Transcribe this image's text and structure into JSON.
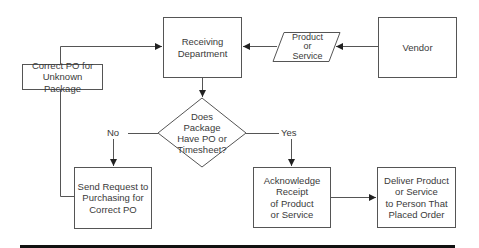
{
  "diagram": {
    "type": "flowchart",
    "nodes": {
      "receiving": {
        "label": "Receiving\nDepartment",
        "shape": "rectangle"
      },
      "product_or_service": {
        "label": "Product\nor\nService",
        "shape": "parallelogram"
      },
      "vendor": {
        "label": "Vendor",
        "shape": "rectangle"
      },
      "correct_po": {
        "label": "Correct PO for\nUnknown Package",
        "shape": "rectangle"
      },
      "decision": {
        "label": "Does\nPackage\nHave PO or\nTimesheet?",
        "shape": "diamond"
      },
      "send_request": {
        "label": "Send Request to\nPurchasing for\nCorrect PO",
        "shape": "rectangle"
      },
      "acknowledge": {
        "label": "Acknowledge\nReceipt\nof Product\nor Service",
        "shape": "rectangle"
      },
      "deliver": {
        "label": "Deliver Product\nor Service\nto Person That\nPlaced Order",
        "shape": "rectangle"
      }
    },
    "edge_labels": {
      "no": "No",
      "yes": "Yes"
    },
    "edges": [
      {
        "from": "vendor",
        "to": "product_or_service"
      },
      {
        "from": "product_or_service",
        "to": "receiving"
      },
      {
        "from": "receiving",
        "to": "decision"
      },
      {
        "from": "decision",
        "to": "send_request",
        "label": "No"
      },
      {
        "from": "decision",
        "to": "acknowledge",
        "label": "Yes"
      },
      {
        "from": "send_request",
        "to": "correct_po"
      },
      {
        "from": "correct_po",
        "to": "receiving"
      },
      {
        "from": "acknowledge",
        "to": "deliver"
      }
    ],
    "colors": {
      "stroke": "#555555",
      "text": "#3a3a3a",
      "bar": "#111111"
    }
  }
}
